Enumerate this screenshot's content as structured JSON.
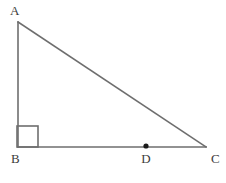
{
  "figure": {
    "type": "geometry-diagram",
    "width": 226,
    "height": 183,
    "background_color": "#ffffff",
    "stroke_color": "#6e6e6e",
    "stroke_width": 1.6,
    "marker_color": "#1a1a1a",
    "label_color": "#3c3c3c"
  },
  "points": {
    "A": {
      "label": "A",
      "x": 18,
      "y": 22,
      "label_x": 10,
      "label_y": 4
    },
    "B": {
      "label": "B",
      "x": 18,
      "y": 147,
      "label_x": 11,
      "label_y": 152
    },
    "C": {
      "label": "C",
      "x": 206,
      "y": 147,
      "label_x": 211,
      "label_y": 152
    },
    "D": {
      "label": "D",
      "x": 146,
      "y": 146,
      "label_x": 146,
      "label_y": 152
    }
  },
  "segments": [
    {
      "name": "side-AB",
      "from": "A",
      "to": "B",
      "x1": 18,
      "y1": 22,
      "x2": 18,
      "y2": 147
    },
    {
      "name": "side-AC",
      "from": "A",
      "to": "C",
      "x1": 18,
      "y1": 22,
      "x2": 206,
      "y2": 147
    },
    {
      "name": "side-BC",
      "from": "B",
      "to": "C",
      "x1": 18,
      "y1": 147,
      "x2": 206,
      "y2": 147
    }
  ],
  "right_angle_marker": {
    "name": "right-angle-at-B",
    "at_vertex": "B",
    "x": 17,
    "y": 126,
    "size": 21,
    "measure": "90"
  },
  "point_markers": [
    {
      "name": "point-D-dot",
      "at_vertex": "D",
      "cx": 146,
      "cy": 146,
      "r": 2.6
    }
  ],
  "labels": {
    "A": "A",
    "B": "B",
    "C": "C",
    "D": "D"
  }
}
